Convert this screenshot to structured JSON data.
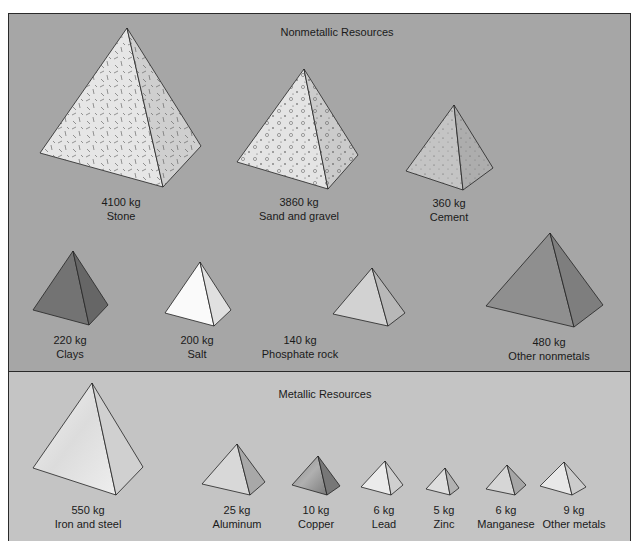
{
  "nonmetallic": {
    "title": "Nonmetallic Resources",
    "items": [
      {
        "amount": "4100 kg",
        "name": "Stone"
      },
      {
        "amount": "3860 kg",
        "name": "Sand and gravel"
      },
      {
        "amount": "360 kg",
        "name": "Cement"
      },
      {
        "amount": "220 kg",
        "name": "Clays"
      },
      {
        "amount": "200 kg",
        "name": "Salt"
      },
      {
        "amount": "140 kg",
        "name": "Phosphate rock"
      },
      {
        "amount": "480 kg",
        "name": "Other nonmetals"
      }
    ]
  },
  "metallic": {
    "title": "Metallic Resources",
    "items": [
      {
        "amount": "550 kg",
        "name": "Iron and steel"
      },
      {
        "amount": "25 kg",
        "name": "Aluminum"
      },
      {
        "amount": "10 kg",
        "name": "Copper"
      },
      {
        "amount": "6 kg",
        "name": "Lead"
      },
      {
        "amount": "5 kg",
        "name": "Zinc"
      },
      {
        "amount": "6 kg",
        "name": "Manganese"
      },
      {
        "amount": "9 kg",
        "name": "Other metals"
      }
    ]
  },
  "colors": {
    "nonmetal_bg": "#a6a6a6",
    "metal_bg": "#c4c4c4",
    "outline": "#2a2a2a"
  }
}
